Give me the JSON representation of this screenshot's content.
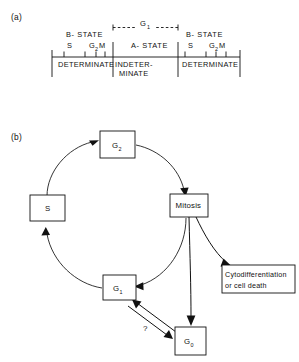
{
  "figure": {
    "panel_a": {
      "label": "(a)",
      "g1_bracket_label": "G",
      "g1_bracket_sub": "1",
      "segments": [
        {
          "id": "b-state-left",
          "state_label": "B- STATE",
          "determinacy": "DETERMINATE",
          "phases": [
            {
              "name": "S"
            },
            {
              "name": "G",
              "sub": "2"
            },
            {
              "name": "M"
            }
          ]
        },
        {
          "id": "a-state",
          "state_label": "A- STATE",
          "determinacy_line1": "INDETER-",
          "determinacy_line2": "MINATE",
          "phases": []
        },
        {
          "id": "b-state-right",
          "state_label": "B- STATE",
          "determinacy": "DETERMINATE",
          "phases": [
            {
              "name": "S"
            },
            {
              "name": "G",
              "sub": "2"
            },
            {
              "name": "M"
            }
          ]
        }
      ]
    },
    "panel_b": {
      "label": "(b)",
      "nodes": [
        {
          "id": "g2",
          "label": "G",
          "sub": "2"
        },
        {
          "id": "s",
          "label": "S",
          "sub": ""
        },
        {
          "id": "mitosis",
          "label": "Mitosis",
          "sub": ""
        },
        {
          "id": "g1",
          "label": "G",
          "sub": "1"
        },
        {
          "id": "g0",
          "label": "G",
          "sub": "0"
        },
        {
          "id": "cyto",
          "line1": "Cytodifferentiation",
          "line2": "or cell death"
        }
      ],
      "question_mark": "?"
    }
  },
  "colors": {
    "ink": "#111111",
    "background": "#ffffff"
  }
}
